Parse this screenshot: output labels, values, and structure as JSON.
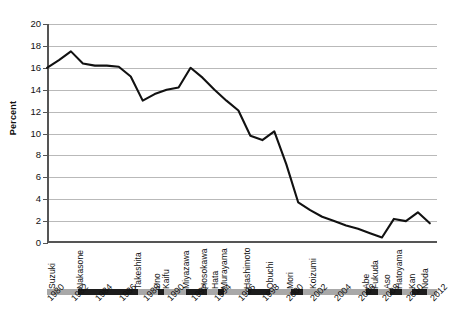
{
  "chart_data": {
    "type": "line",
    "title": "",
    "xlabel": "",
    "ylabel": "Percent",
    "ylim": [
      0,
      20
    ],
    "ytick_step": 2,
    "yticks": [
      "20",
      "18",
      "16",
      "14",
      "12",
      "10",
      "8",
      "6",
      "4",
      "2",
      "0"
    ],
    "xlim": [
      1980,
      2012.6
    ],
    "xticks": [
      "1980",
      "1982",
      "1984",
      "1986",
      "1988",
      "1990",
      "1992",
      "1994",
      "1996",
      "1998",
      "2000",
      "2002",
      "2004",
      "2006",
      "2008",
      "2010",
      "2012"
    ],
    "grid": true,
    "grid_axis": "y",
    "legend": "none",
    "line_color": "#111111",
    "grid_color": "#b9b9b9",
    "axis_color": "#555555",
    "x": [
      1980,
      1981,
      1982,
      1983,
      1984,
      1985,
      1986,
      1987,
      1988,
      1989,
      1990,
      1991,
      1992,
      1993,
      1994,
      1995,
      1996,
      1997,
      1998,
      1999,
      2000,
      2001,
      2002,
      2003,
      2004,
      2005,
      2006,
      2007,
      2008,
      2009,
      2010,
      2011,
      2012
    ],
    "values": [
      16.0,
      16.7,
      17.5,
      16.4,
      16.2,
      16.2,
      16.1,
      15.2,
      13.0,
      13.6,
      14.0,
      14.2,
      16.0,
      15.1,
      14.0,
      13.0,
      12.1,
      9.8,
      9.4,
      10.2,
      7.2,
      3.7,
      3.0,
      2.4,
      2.0,
      1.6,
      1.3,
      0.9,
      0.5,
      2.2,
      2.0,
      2.8,
      1.8
    ]
  },
  "axis": {
    "y_title": "Percent"
  },
  "pm_timeline": {
    "names": [
      {
        "label": "Suzuki",
        "year": 1980.6,
        "shade": "light"
      },
      {
        "label": "Nakasone",
        "year": 1982.9,
        "shade": "dark"
      },
      {
        "label": "Takeshita",
        "year": 1987.8,
        "shade": "light"
      },
      {
        "label": "Uno",
        "year": 1989.4,
        "shade": "dark"
      },
      {
        "label": "Kaifu",
        "year": 1990.1,
        "shade": "light"
      },
      {
        "label": "Miyazawa",
        "year": 1991.8,
        "shade": "dark"
      },
      {
        "label": "Hosokawa",
        "year": 1993.3,
        "shade": "light"
      },
      {
        "label": "Hata",
        "year": 1994.2,
        "shade": "dark"
      },
      {
        "label": "Murayama",
        "year": 1995.0,
        "shade": "light"
      },
      {
        "label": "Hashimoto",
        "year": 1996.9,
        "shade": "dark"
      },
      {
        "label": "Obuchi",
        "year": 1998.8,
        "shade": "light"
      },
      {
        "label": "Mori",
        "year": 2000.5,
        "shade": "dark"
      },
      {
        "label": "Koizumi",
        "year": 2002.4,
        "shade": "light"
      },
      {
        "label": "Abe",
        "year": 2006.8,
        "shade": "dark"
      },
      {
        "label": "Fukuda",
        "year": 2007.6,
        "shade": "light"
      },
      {
        "label": "Aso",
        "year": 2008.6,
        "shade": "dark"
      },
      {
        "label": "Hatoyama",
        "year": 2009.6,
        "shade": "light"
      },
      {
        "label": "Kan",
        "year": 2010.7,
        "shade": "dark"
      },
      {
        "label": "Noda",
        "year": 2011.8,
        "shade": "light"
      }
    ],
    "segments": [
      {
        "from": 1980.0,
        "to": 1982.6,
        "shade": "light"
      },
      {
        "from": 1982.6,
        "to": 1987.6,
        "shade": "dark"
      },
      {
        "from": 1987.6,
        "to": 1989.3,
        "shade": "light"
      },
      {
        "from": 1989.3,
        "to": 1989.8,
        "shade": "dark"
      },
      {
        "from": 1989.8,
        "to": 1991.6,
        "shade": "light"
      },
      {
        "from": 1991.6,
        "to": 1993.4,
        "shade": "dark"
      },
      {
        "from": 1993.4,
        "to": 1994.3,
        "shade": "light"
      },
      {
        "from": 1994.3,
        "to": 1994.8,
        "shade": "dark"
      },
      {
        "from": 1994.8,
        "to": 1996.8,
        "shade": "light"
      },
      {
        "from": 1996.8,
        "to": 1998.6,
        "shade": "dark"
      },
      {
        "from": 1998.6,
        "to": 2000.4,
        "shade": "light"
      },
      {
        "from": 2000.4,
        "to": 2001.4,
        "shade": "dark"
      },
      {
        "from": 2001.4,
        "to": 2006.7,
        "shade": "light"
      },
      {
        "from": 2006.7,
        "to": 2007.7,
        "shade": "dark"
      },
      {
        "from": 2007.7,
        "to": 2008.7,
        "shade": "light"
      },
      {
        "from": 2008.7,
        "to": 2009.7,
        "shade": "dark"
      },
      {
        "from": 2009.7,
        "to": 2010.5,
        "shade": "light"
      },
      {
        "from": 2010.5,
        "to": 2011.8,
        "shade": "dark"
      },
      {
        "from": 2011.8,
        "to": 2012.6,
        "shade": "light"
      }
    ]
  }
}
